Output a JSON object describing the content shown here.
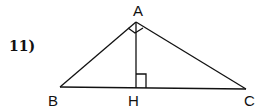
{
  "problem": {
    "number": "11)"
  },
  "figure": {
    "type": "right-triangle-with-altitude",
    "vertices": {
      "A": {
        "label": "A",
        "x": 136,
        "y": 22
      },
      "B": {
        "label": "B",
        "x": 60,
        "y": 87
      },
      "C": {
        "label": "C",
        "x": 246,
        "y": 89
      },
      "H": {
        "label": "H",
        "x": 136,
        "y": 88
      }
    },
    "right_angles": [
      "BAC",
      "AHC"
    ],
    "stroke_color": "#111111"
  }
}
